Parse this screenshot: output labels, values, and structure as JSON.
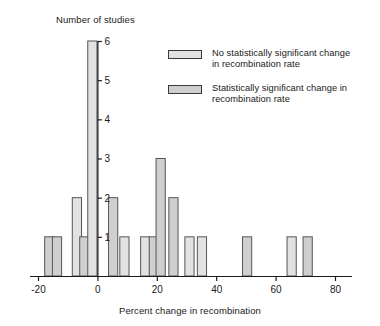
{
  "chart_data": {
    "type": "bar",
    "title": "",
    "xlabel": "Percent change in recombination",
    "ylabel": "Number of studies",
    "xlim": [
      -24,
      84
    ],
    "ylim": [
      0,
      6
    ],
    "xticks": [
      -20,
      0,
      20,
      40,
      60,
      80
    ],
    "xticklabels": [
      "-20",
      "0",
      "20",
      "40",
      "60",
      "80"
    ],
    "yticks": [
      1,
      2,
      3,
      4,
      5,
      6
    ],
    "yticklabels": [
      "1",
      "2",
      "3",
      "4",
      "5",
      "6"
    ],
    "grid": false,
    "bar_width": 3.1,
    "bars": [
      {
        "x": -16.2,
        "value": 1,
        "series": "significant"
      },
      {
        "x": -13.6,
        "value": 1,
        "series": "significant"
      },
      {
        "x": -6.9,
        "value": 2,
        "series": "no_change"
      },
      {
        "x": -4.4,
        "value": 1,
        "series": "significant"
      },
      {
        "x": -1.7,
        "value": 6,
        "series": "no_change"
      },
      {
        "x": 5.3,
        "value": 2,
        "series": "significant"
      },
      {
        "x": 9.1,
        "value": 1,
        "series": "no_change"
      },
      {
        "x": 16.1,
        "value": 1,
        "series": "no_change"
      },
      {
        "x": 19.0,
        "value": 1,
        "series": "significant"
      },
      {
        "x": 21.3,
        "value": 3,
        "series": "significant"
      },
      {
        "x": 25.6,
        "value": 2,
        "series": "significant"
      },
      {
        "x": 31.0,
        "value": 1,
        "series": "no_change"
      },
      {
        "x": 35.2,
        "value": 1,
        "series": "no_change"
      },
      {
        "x": 50.4,
        "value": 1,
        "series": "significant"
      },
      {
        "x": 65.4,
        "value": 1,
        "series": "no_change"
      },
      {
        "x": 70.8,
        "value": 1,
        "series": "significant"
      }
    ],
    "series": [
      {
        "name": "no_change",
        "label": "No statistically significant change in recombination rate",
        "color": "#e2e2e2"
      },
      {
        "name": "significant",
        "label": "Statistically significant change in recombination rate",
        "color": "#cfcfcf"
      }
    ],
    "legend_position": "upper right"
  },
  "axes": {
    "y_axis_title": "Number of studies",
    "x_axis_title": "Percent change in recombination"
  },
  "legend": {
    "entries": [
      {
        "line1": "No statistically significant change",
        "line2": "in recombination rate",
        "swatch": "no_change"
      },
      {
        "line1": "Statistically significant change in",
        "line2": "recombination rate",
        "swatch": "significant"
      }
    ]
  },
  "colors": {
    "bar_fill_light": "#e2e2e2",
    "bar_fill_dark": "#cfcfcf",
    "bar_stroke": "#555555",
    "axis": "#1a1a1a",
    "text": "#1a1a1a",
    "background": "#ffffff"
  }
}
